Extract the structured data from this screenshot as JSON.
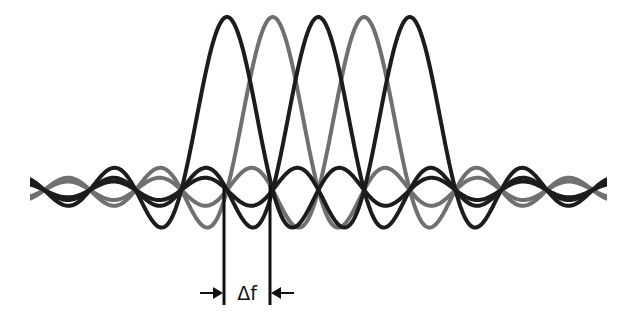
{
  "diagram": {
    "type": "ofdm-subcarrier-spectrum",
    "subcarrier_count": 5,
    "spacing_label": "Δf",
    "baseline_y": 190,
    "peak_y": 17,
    "x_start": 30,
    "x_end": 607,
    "spacing_px": 45.7,
    "centers_px": [
      227,
      272.7,
      318.4,
      364.1,
      409.8
    ],
    "colors": [
      "#1c1c1c",
      "#707070",
      "#1c1c1c",
      "#707070",
      "#1c1c1c"
    ],
    "marker_lines_x": [
      224,
      270
    ],
    "marker_line_top": 185,
    "marker_line_bottom": 305,
    "arrow_y": 293
  }
}
